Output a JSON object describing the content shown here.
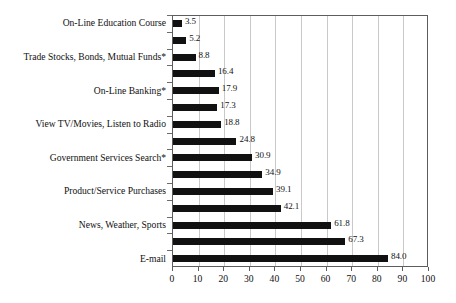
{
  "chart_data": {
    "type": "bar",
    "orientation": "horizontal",
    "title": "",
    "xlabel": "",
    "ylabel": "",
    "xlim": [
      0,
      100
    ],
    "xticks": [
      0,
      10,
      20,
      30,
      40,
      50,
      60,
      70,
      80,
      90,
      100
    ],
    "grid": true,
    "grid_axis": "x",
    "legend": "none",
    "bar_color": "#111111",
    "categories": [
      "On-Line Education Course",
      "",
      "Trade Stocks, Bonds, Mutual Funds*",
      "",
      "On-Line Banking*",
      "",
      "View TV/Movies, Listen to Radio",
      "",
      "Government Services Search*",
      "",
      "Product/Service Purchases",
      "",
      "News, Weather, Sports",
      "",
      "E-mail"
    ],
    "values": [
      3.5,
      5.2,
      8.8,
      16.4,
      17.9,
      17.3,
      18.8,
      24.8,
      30.9,
      34.9,
      39.1,
      42.1,
      61.8,
      67.3,
      84.0
    ],
    "value_labels": [
      "3.5",
      "5.2",
      "8.8",
      "16.4",
      "17.9",
      "17.3",
      "18.8",
      "24.8",
      "30.9",
      "34.9",
      "39.1",
      "42.1",
      "61.8",
      "67.3",
      "84.0"
    ],
    "labeled_categories": [
      "On-Line Education Course",
      "Trade Stocks, Bonds, Mutual Funds*",
      "On-Line Banking*",
      "View TV/Movies, Listen to Radio",
      "Government Services Search*",
      "Product/Service Purchases",
      "News, Weather, Sports",
      "E-mail"
    ]
  }
}
